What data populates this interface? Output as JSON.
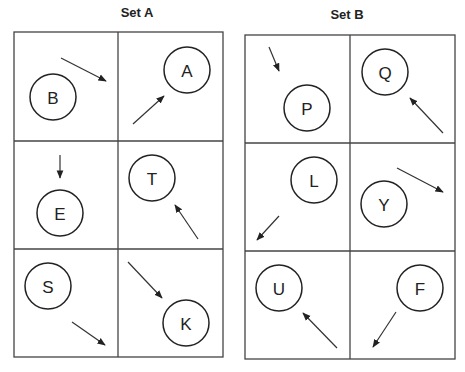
{
  "sets": [
    {
      "title": "Set A",
      "frame": {
        "x": 14,
        "y": 32,
        "w": 209,
        "h": 325,
        "col_split": 118,
        "row_splits": [
          141,
          249
        ]
      },
      "cells": [
        {
          "letter": "B",
          "circle": {
            "cx": 53,
            "cy": 97,
            "r": 23
          },
          "arrow": {
            "x1": 61,
            "y1": 58,
            "x2": 106,
            "y2": 81
          }
        },
        {
          "letter": "A",
          "circle": {
            "cx": 187,
            "cy": 70,
            "r": 23
          },
          "arrow": {
            "x1": 133,
            "y1": 124,
            "x2": 164,
            "y2": 96
          }
        },
        {
          "letter": "E",
          "circle": {
            "cx": 60,
            "cy": 213,
            "r": 23
          },
          "arrow": {
            "x1": 60,
            "y1": 155,
            "x2": 60,
            "y2": 178
          }
        },
        {
          "letter": "T",
          "circle": {
            "cx": 152,
            "cy": 178,
            "r": 23
          },
          "arrow": {
            "x1": 198,
            "y1": 239,
            "x2": 175,
            "y2": 205
          }
        },
        {
          "letter": "S",
          "circle": {
            "cx": 48,
            "cy": 286,
            "r": 23
          },
          "arrow": {
            "x1": 72,
            "y1": 322,
            "x2": 105,
            "y2": 345
          }
        },
        {
          "letter": "K",
          "circle": {
            "cx": 186,
            "cy": 323,
            "r": 23
          },
          "arrow": {
            "x1": 128,
            "y1": 262,
            "x2": 162,
            "y2": 298
          }
        }
      ]
    },
    {
      "title": "Set B",
      "frame": {
        "x": 245,
        "y": 35,
        "w": 210,
        "h": 324,
        "col_split": 350,
        "row_splits": [
          143,
          251
        ]
      },
      "cells": [
        {
          "letter": "P",
          "circle": {
            "cx": 307,
            "cy": 108,
            "r": 23
          },
          "arrow": {
            "x1": 269,
            "y1": 47,
            "x2": 279,
            "y2": 71
          }
        },
        {
          "letter": "Q",
          "circle": {
            "cx": 385,
            "cy": 72,
            "r": 23
          },
          "arrow": {
            "x1": 443,
            "y1": 133,
            "x2": 410,
            "y2": 98
          }
        },
        {
          "letter": "L",
          "circle": {
            "cx": 314,
            "cy": 180,
            "r": 23
          },
          "arrow": {
            "x1": 279,
            "y1": 216,
            "x2": 257,
            "y2": 240
          }
        },
        {
          "letter": "Y",
          "circle": {
            "cx": 384,
            "cy": 204,
            "r": 23
          },
          "arrow": {
            "x1": 397,
            "y1": 168,
            "x2": 443,
            "y2": 192
          }
        },
        {
          "letter": "U",
          "circle": {
            "cx": 279,
            "cy": 288,
            "r": 23
          },
          "arrow": {
            "x1": 337,
            "y1": 348,
            "x2": 303,
            "y2": 313
          }
        },
        {
          "letter": "F",
          "circle": {
            "cx": 420,
            "cy": 288,
            "r": 23
          },
          "arrow": {
            "x1": 396,
            "y1": 312,
            "x2": 373,
            "y2": 347
          }
        }
      ]
    }
  ]
}
